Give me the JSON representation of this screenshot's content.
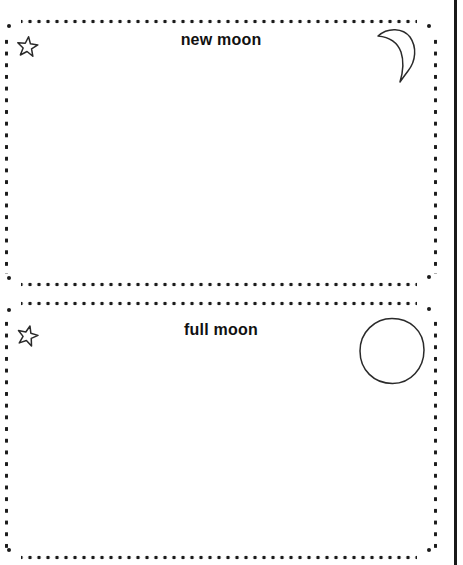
{
  "cards": [
    {
      "title": "new moon",
      "corner_icon": "star-icon",
      "illustration_icon": "crescent-moon-icon"
    },
    {
      "title": "full moon",
      "corner_icon": "star-icon",
      "illustration_icon": "full-moon-icon"
    }
  ],
  "colors": {
    "background": "#ffffff",
    "dots": "#1b1b1b",
    "text": "#111111",
    "line_art": "#2a2a2a",
    "page_edge_line": "#191919"
  }
}
